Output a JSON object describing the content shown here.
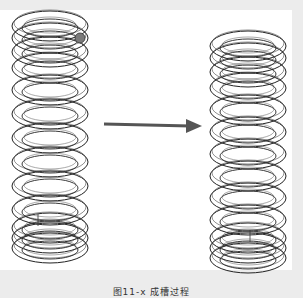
{
  "figure": {
    "left_spring": {
      "label": "coil-spring-before",
      "coils": 13,
      "marker_color": "#7a7a7a"
    },
    "right_spring": {
      "label": "coil-spring-after",
      "coils": 13
    },
    "arrow": {
      "direction": "right",
      "color": "#555555"
    }
  },
  "caption": {
    "text": "图11-x 成槽过程"
  },
  "colors": {
    "background": "#ececec",
    "panel": "#ffffff",
    "line": "#222222"
  }
}
